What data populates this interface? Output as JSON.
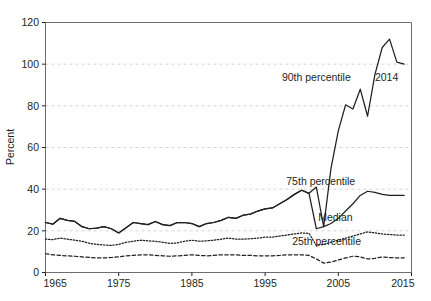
{
  "chart_data": {
    "type": "line",
    "title": "",
    "xlabel": "",
    "ylabel": "Percent",
    "xlim": [
      1965,
      2015
    ],
    "ylim": [
      0,
      120
    ],
    "xticks": [
      1965,
      1975,
      1985,
      1995,
      2005,
      2015
    ],
    "xtick_labels": [
      "1965",
      "1975",
      "1985",
      "1995",
      "2005",
      "2015"
    ],
    "yticks": [
      0,
      20,
      40,
      60,
      80,
      100,
      120
    ],
    "ytick_labels": [
      "0",
      "20",
      "40",
      "60",
      "80",
      "100",
      "120"
    ],
    "grid": true,
    "grid_axis": "y",
    "legend_position": "inline-annotations",
    "annotations": [
      {
        "text": "90th percentile",
        "x": 2002.0,
        "y": 92.0,
        "name": "annotation-90th-percentile"
      },
      {
        "text": "2014",
        "x": 2011.6,
        "y": 92.0,
        "name": "annotation-2014"
      },
      {
        "text": "75th percentile",
        "x": 2002.6,
        "y": 42.0,
        "name": "annotation-75th-percentile"
      },
      {
        "text": "Median",
        "x": 2004.6,
        "y": 24.5,
        "name": "annotation-median"
      },
      {
        "text": "25th percentile",
        "x": 2003.4,
        "y": 13.0,
        "name": "annotation-25th-percentile"
      }
    ],
    "x": [
      1965,
      1966,
      1967,
      1968,
      1969,
      1970,
      1971,
      1972,
      1973,
      1974,
      1975,
      1976,
      1977,
      1978,
      1979,
      1980,
      1981,
      1982,
      1983,
      1984,
      1985,
      1986,
      1987,
      1988,
      1989,
      1990,
      1991,
      1992,
      1993,
      1994,
      1995,
      1996,
      1997,
      1998,
      1999,
      2000,
      2001,
      2002,
      2003,
      2004,
      2005,
      2006,
      2007,
      2008,
      2009,
      2010,
      2011,
      2012,
      2013,
      2014
    ],
    "series": [
      {
        "name": "90th percentile",
        "style": "solid",
        "values": [
          24.0,
          23.2,
          26.0,
          25.0,
          24.5,
          22.0,
          21.0,
          21.3,
          22.0,
          21.0,
          19.0,
          21.5,
          24.0,
          23.5,
          23.0,
          24.5,
          23.0,
          22.5,
          24.0,
          24.0,
          23.5,
          22.0,
          23.5,
          24.0,
          25.0,
          26.5,
          26.0,
          27.5,
          28.0,
          29.5,
          30.5,
          31.0,
          33.0,
          35.0,
          37.5,
          39.5,
          38.0,
          41.0,
          22.0,
          50.0,
          68.0,
          80.5,
          78.5,
          88.0,
          75.0,
          95.0,
          108.0,
          112.0,
          101.0,
          100.0
        ]
      },
      {
        "name": "75th percentile",
        "style": "solid",
        "values": [
          24.0,
          23.2,
          26.0,
          25.0,
          24.5,
          22.0,
          21.0,
          21.3,
          22.0,
          21.0,
          19.0,
          21.5,
          24.0,
          23.5,
          23.0,
          24.5,
          23.0,
          22.5,
          24.0,
          24.0,
          23.5,
          22.0,
          23.5,
          24.0,
          25.0,
          26.5,
          26.0,
          27.5,
          28.0,
          29.5,
          30.5,
          31.0,
          33.0,
          35.0,
          37.5,
          39.5,
          38.0,
          21.0,
          22.0,
          23.5,
          26.0,
          29.5,
          33.0,
          37.0,
          39.0,
          38.5,
          37.5,
          37.0,
          37.0,
          37.0
        ]
      },
      {
        "name": "Median",
        "style": "dotted",
        "values": [
          16.0,
          15.8,
          16.5,
          16.0,
          15.5,
          15.0,
          14.0,
          13.5,
          13.2,
          13.0,
          13.5,
          14.5,
          15.0,
          15.5,
          15.2,
          15.0,
          14.5,
          14.0,
          14.2,
          15.0,
          15.5,
          15.0,
          15.2,
          15.5,
          16.0,
          16.5,
          16.0,
          16.0,
          16.2,
          16.5,
          17.0,
          17.0,
          17.5,
          18.0,
          18.5,
          19.0,
          18.8,
          13.0,
          13.5,
          14.5,
          15.5,
          16.5,
          17.5,
          18.5,
          19.5,
          19.0,
          18.5,
          18.2,
          18.0,
          18.0
        ]
      },
      {
        "name": "25th percentile",
        "style": "dashed",
        "values": [
          9.0,
          8.5,
          8.2,
          8.0,
          7.8,
          7.5,
          7.2,
          7.0,
          7.0,
          7.2,
          7.5,
          8.0,
          8.2,
          8.5,
          8.5,
          8.2,
          8.0,
          7.8,
          8.0,
          8.2,
          8.5,
          8.2,
          8.0,
          8.2,
          8.5,
          8.5,
          8.5,
          8.2,
          8.2,
          8.0,
          8.0,
          8.0,
          8.2,
          8.5,
          8.5,
          8.5,
          8.2,
          6.5,
          4.5,
          5.0,
          6.0,
          7.0,
          7.8,
          7.5,
          6.5,
          6.8,
          7.5,
          7.2,
          7.0,
          7.0
        ]
      }
    ]
  }
}
